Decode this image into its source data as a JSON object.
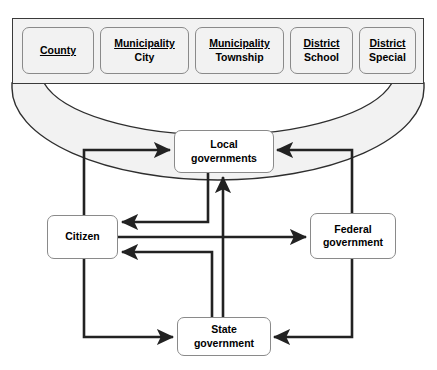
{
  "diagram": {
    "colors": {
      "arrow": "#222222",
      "node_border": "#8a8a8a",
      "band_fill": "#f2f2f2",
      "frame_border": "#3a3a3a",
      "text": "#000000"
    },
    "local_types": [
      {
        "head": "County",
        "sub": ""
      },
      {
        "head": "Municipality",
        "sub": "City"
      },
      {
        "head": "Municipality",
        "sub": "Township"
      },
      {
        "head": "District",
        "sub": "School"
      },
      {
        "head": "District",
        "sub": "Special"
      }
    ],
    "nodes": {
      "local": "Local\ngovernments",
      "citizen": "Citizen",
      "federal": "Federal\ngovernment",
      "state": "State\ngovernment"
    },
    "connections": [
      {
        "from": "citizen",
        "to": "local",
        "direction": "to"
      },
      {
        "from": "federal",
        "to": "local",
        "direction": "to"
      },
      {
        "from": "state",
        "to": "local",
        "direction": "to"
      },
      {
        "from": "local",
        "to": "citizen",
        "direction": "to"
      },
      {
        "from": "citizen",
        "to": "federal",
        "direction": "to"
      },
      {
        "from": "state",
        "to": "citizen",
        "direction": "to"
      },
      {
        "from": "citizen",
        "to": "state",
        "direction": "to"
      },
      {
        "from": "federal",
        "to": "state",
        "direction": "to"
      }
    ]
  }
}
